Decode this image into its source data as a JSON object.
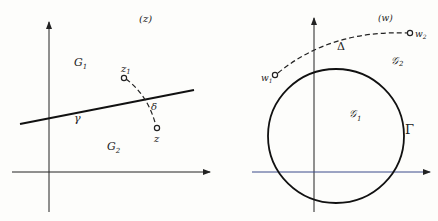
{
  "left_panel": {
    "plane_label": "(z)",
    "region_upper": "G",
    "region_upper_sub": "1",
    "region_lower": "G",
    "region_lower_sub": "2",
    "curve_label": "γ",
    "path_label": "δ",
    "point_start": "z",
    "point_start_sub": "1",
    "point_end": "z"
  },
  "right_panel": {
    "plane_label": "(w)",
    "region_inner": "𝒢",
    "region_inner_sub": "1",
    "region_outer": "𝒢",
    "region_outer_sub": "2",
    "curve_label": "Γ",
    "path_label": "Δ",
    "point_start": "w",
    "point_start_sub": "1",
    "point_end": "w",
    "point_end_sub": "2"
  },
  "colors": {
    "ink": "#222222",
    "x_axis_right_tint": "#3a4a8a"
  }
}
